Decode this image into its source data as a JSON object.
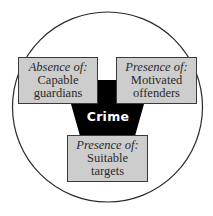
{
  "diagram": {
    "colors": {
      "circle_stroke": "#2a2a2a",
      "box_fill": "#cdcdcd",
      "box_border": "#3a3a3a",
      "center_fill": "#000000",
      "center_text": "#ffffff"
    },
    "center": {
      "label": "Crime"
    },
    "boxes": [
      {
        "id": "guardians",
        "heading": "Absence of:",
        "lines": [
          "Capable",
          "guardians"
        ]
      },
      {
        "id": "offenders",
        "heading": "Presence of:",
        "lines": [
          "Motivated",
          "offenders"
        ]
      },
      {
        "id": "targets",
        "heading": "Presence of:",
        "lines": [
          "Suitable",
          "targets"
        ]
      }
    ]
  }
}
